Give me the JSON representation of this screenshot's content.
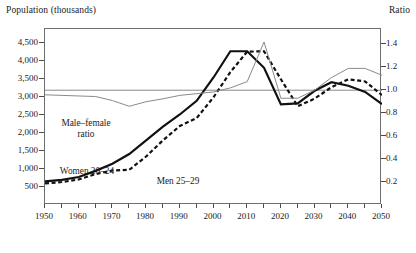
{
  "header": {
    "left_axis_title": "Population (thousands)",
    "right_axis_title": "Ratio"
  },
  "annotations": {
    "ratio_line_1": "Male–female",
    "ratio_line_2": "ratio",
    "women": "Women 20–24",
    "men": "Men 25–29"
  },
  "chart_data": {
    "type": "line",
    "title": "",
    "xlabel": "",
    "ylabel": "Population (thousands)",
    "y2label": "Ratio",
    "xlim": [
      1950,
      2050
    ],
    "ylim": [
      0,
      4900
    ],
    "y2lim": [
      0,
      1.5333
    ],
    "grid": false,
    "legend": "inline-annotations",
    "xticks": [
      1950,
      1955,
      1960,
      1965,
      1970,
      1975,
      1980,
      1985,
      1990,
      1995,
      2000,
      2005,
      2010,
      2015,
      2020,
      2025,
      2030,
      2035,
      2040,
      2045,
      2050
    ],
    "xticklabels": [
      "1950",
      "",
      "1960",
      "",
      "1970",
      "",
      "1980",
      "",
      "1990",
      "",
      "2000",
      "",
      "2010",
      "",
      "2020",
      "",
      "2030",
      "",
      "2040",
      "",
      "2050"
    ],
    "yticks": [
      500,
      1000,
      1500,
      2000,
      2500,
      3000,
      3500,
      4000,
      4500
    ],
    "yticklabels": [
      "500",
      "1,000",
      "1,500",
      "2,000",
      "2,500",
      "3,000",
      "3,500",
      "4,000",
      "4,500"
    ],
    "y2ticks": [
      0.2,
      0.4,
      0.6,
      0.8,
      1.0,
      1.2,
      1.4
    ],
    "y2ticklabels": [
      "0.2",
      "0.4",
      "0.6",
      "0.8",
      "1.0",
      "1.2",
      "1.4"
    ],
    "reference_line": {
      "axis": "right",
      "value": 1.0,
      "color": "#8a8a8a"
    },
    "x": [
      1950,
      1955,
      1960,
      1965,
      1970,
      1975,
      1980,
      1985,
      1990,
      1995,
      2000,
      2005,
      2010,
      2015,
      2020,
      2025,
      2030,
      2035,
      2040,
      2045,
      2050
    ],
    "series": [
      {
        "name": "Women 20–24",
        "axis": "left",
        "style": "solid",
        "color": "#111111",
        "width": 2.2,
        "values": [
          660,
          700,
          780,
          950,
          1150,
          1420,
          1800,
          2180,
          2520,
          2900,
          3550,
          4280,
          4280,
          3820,
          2800,
          2830,
          3180,
          3420,
          3320,
          3150,
          2810
        ]
      },
      {
        "name": "Men 25–29",
        "axis": "left",
        "style": "dashed",
        "color": "#111111",
        "width": 2.2,
        "values": [
          600,
          640,
          710,
          860,
          960,
          980,
          1350,
          1800,
          2200,
          2420,
          3000,
          3700,
          4270,
          4280,
          3500,
          2750,
          2960,
          3280,
          3500,
          3440,
          3060
        ]
      },
      {
        "name": "Male–female ratio",
        "axis": "right",
        "style": "solid",
        "color": "#8a8a8a",
        "width": 1.0,
        "values": [
          0.96,
          0.955,
          0.95,
          0.945,
          0.91,
          0.86,
          0.9,
          0.925,
          0.955,
          0.97,
          0.985,
          1.02,
          1.075,
          1.42,
          0.93,
          0.93,
          1.0,
          1.11,
          1.19,
          1.19,
          1.13
        ]
      }
    ]
  }
}
